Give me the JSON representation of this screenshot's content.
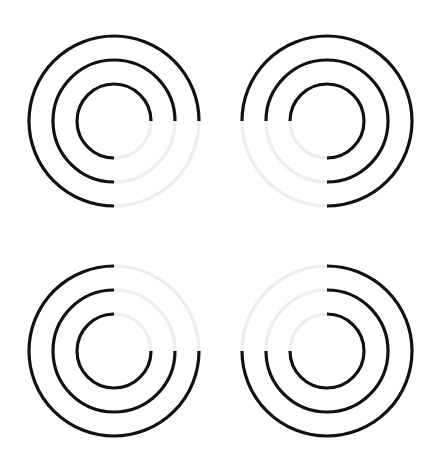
{
  "page": {
    "background_color": "#ffffff",
    "width": 443,
    "height": 474
  },
  "style": {
    "dark_color": "#111111",
    "faint_color": "#ededed",
    "stroke_width": 3.2
  },
  "chart_data": {
    "type": "diagram",
    "title": "",
    "subtitle": "",
    "xlabel": "",
    "ylabel": "",
    "grid": false,
    "legend": "none",
    "ring_radii": [
      37,
      61,
      85
    ],
    "ring_count": 3,
    "rings_stroke_width": 3.2,
    "grid_layout": {
      "rows": 2,
      "cols": 2
    },
    "figures": [
      {
        "id": "figure-top-left",
        "position": "top-left",
        "center_x": 114,
        "center_y": 121,
        "radii": [
          37,
          61,
          85
        ],
        "faint_quadrant": "bottom-right",
        "faint_start_deg": 0,
        "faint_end_deg": 90,
        "dark_start_deg": 90,
        "dark_end_deg": 360
      },
      {
        "id": "figure-top-right",
        "position": "top-right",
        "center_x": 327,
        "center_y": 121,
        "radii": [
          37,
          61,
          85
        ],
        "faint_quadrant": "bottom-left",
        "faint_start_deg": 90,
        "faint_end_deg": 180,
        "dark_start_deg": 180,
        "dark_end_deg": 450
      },
      {
        "id": "figure-bottom-left",
        "position": "bottom-left",
        "center_x": 114,
        "center_y": 351,
        "radii": [
          37,
          61,
          85
        ],
        "faint_quadrant": "top-right",
        "faint_start_deg": 270,
        "faint_end_deg": 360,
        "dark_start_deg": 0,
        "dark_end_deg": 270
      },
      {
        "id": "figure-bottom-right",
        "position": "bottom-right",
        "center_x": 327,
        "center_y": 351,
        "radii": [
          37,
          61,
          85
        ],
        "faint_quadrant": "top-left",
        "faint_start_deg": 180,
        "faint_end_deg": 270,
        "dark_start_deg": 270,
        "dark_end_deg": 540
      }
    ]
  }
}
